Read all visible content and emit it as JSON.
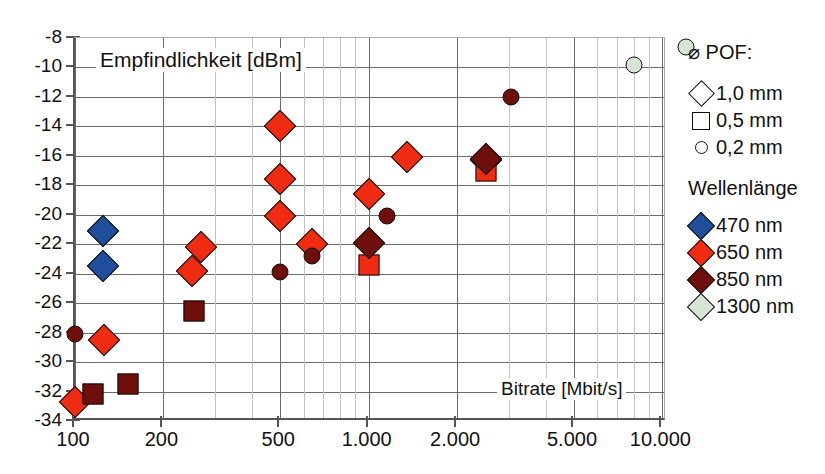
{
  "chart_data": {
    "type": "scatter",
    "title": "",
    "xlabel": "Bitrate [Mbit/s]",
    "ylabel": "Empfindlichkeit [dBm]",
    "xscale": "log",
    "xlim": [
      100,
      13000
    ],
    "ylim": [
      -34,
      -8
    ],
    "grid": true,
    "legend_position": "right",
    "xticks": [
      "100",
      "200",
      "500",
      "1.000",
      "2.000",
      "5.000",
      "10.000"
    ],
    "xtick_values": [
      100,
      200,
      500,
      1000,
      2000,
      5000,
      10000
    ],
    "yticks": [
      "-8",
      "-10",
      "-12",
      "-14",
      "-16",
      "-18",
      "-20",
      "-22",
      "-24",
      "-26",
      "-28",
      "-30",
      "-32",
      "-34"
    ],
    "ytick_values": [
      -8,
      -10,
      -12,
      -14,
      -16,
      -18,
      -20,
      -22,
      -24,
      -26,
      -28,
      -30,
      -32,
      -34
    ],
    "series": [
      {
        "name": "470 nm",
        "color": "#1f4e9c",
        "points": [
          {
            "x": 125,
            "y": -21.1,
            "marker": "diamond",
            "pof": "1,0 mm"
          },
          {
            "x": 125,
            "y": -23.5,
            "marker": "diamond",
            "pof": "1,0 mm"
          }
        ]
      },
      {
        "name": "650 nm",
        "color": "#ef2b11",
        "points": [
          {
            "x": 100,
            "y": -32.7,
            "marker": "diamond",
            "pof": "1,0 mm"
          },
          {
            "x": 126,
            "y": -28.5,
            "marker": "diamond",
            "pof": "1,0 mm"
          },
          {
            "x": 250,
            "y": -23.8,
            "marker": "diamond",
            "pof": "1,0 mm"
          },
          {
            "x": 268,
            "y": -22.2,
            "marker": "diamond",
            "pof": "1,0 mm"
          },
          {
            "x": 500,
            "y": -14.0,
            "marker": "diamond",
            "pof": "1,0 mm"
          },
          {
            "x": 500,
            "y": -17.6,
            "marker": "diamond",
            "pof": "1,0 mm"
          },
          {
            "x": 500,
            "y": -20.1,
            "marker": "diamond",
            "pof": "1,0 mm"
          },
          {
            "x": 640,
            "y": -22.0,
            "marker": "diamond",
            "pof": "1,0 mm"
          },
          {
            "x": 1000,
            "y": -18.6,
            "marker": "diamond",
            "pof": "1,0 mm"
          },
          {
            "x": 1350,
            "y": -16.1,
            "marker": "diamond",
            "pof": "1,0 mm"
          },
          {
            "x": 2500,
            "y": -16.3,
            "marker": "diamond",
            "pof": "1,0 mm"
          },
          {
            "x": 1000,
            "y": -23.4,
            "marker": "square",
            "pof": "0,5 mm"
          },
          {
            "x": 2500,
            "y": -17.0,
            "marker": "square",
            "pof": "0,5 mm"
          }
        ]
      },
      {
        "name": "850 nm",
        "color": "#6e0f0b",
        "points": [
          {
            "x": 1000,
            "y": -21.9,
            "marker": "diamond",
            "pof": "1,0 mm"
          },
          {
            "x": 2500,
            "y": -16.2,
            "marker": "diamond",
            "pof": "1,0 mm"
          },
          {
            "x": 115,
            "y": -32.2,
            "marker": "square",
            "pof": "0,5 mm"
          },
          {
            "x": 152,
            "y": -31.5,
            "marker": "square",
            "pof": "0,5 mm"
          },
          {
            "x": 255,
            "y": -26.5,
            "marker": "square",
            "pof": "0,5 mm"
          },
          {
            "x": 100,
            "y": -28.1,
            "marker": "circle",
            "pof": "0,2 mm"
          },
          {
            "x": 500,
            "y": -23.9,
            "marker": "circle",
            "pof": "0,2 mm"
          },
          {
            "x": 640,
            "y": -22.8,
            "marker": "circle",
            "pof": "0,2 mm"
          },
          {
            "x": 1150,
            "y": -20.1,
            "marker": "circle",
            "pof": "0,2 mm"
          },
          {
            "x": 3050,
            "y": -12.0,
            "marker": "circle",
            "pof": "0,2 mm"
          }
        ]
      },
      {
        "name": "1300 nm",
        "color": "#d6e4d6",
        "points": [
          {
            "x": 8000,
            "y": -9.8,
            "marker": "circle",
            "pof": "0,2 mm"
          },
          {
            "x": 12000,
            "y": -8.6,
            "marker": "circle",
            "pof": "0,2 mm"
          }
        ]
      }
    ]
  },
  "legend": {
    "pof_title": "⌀ POF:",
    "pof_items": [
      {
        "label": "1,0 mm",
        "icon": "diamond-outline-icon"
      },
      {
        "label": "0,5 mm",
        "icon": "square-outline-icon"
      },
      {
        "label": "0,2 mm",
        "icon": "circle-outline-icon"
      }
    ],
    "wavelength_title": "Wellenlänge",
    "wavelength_items": [
      {
        "label": "470 nm",
        "color": "#1f4e9c"
      },
      {
        "label": "650 nm",
        "color": "#ef2b11"
      },
      {
        "label": "850 nm",
        "color": "#6e0f0b"
      },
      {
        "label": "1300 nm",
        "color": "#d6e4d6"
      }
    ]
  },
  "colors": {
    "blue_470": "#1f4e9c",
    "red_650": "#ef2b11",
    "darkred_850": "#6e0f0b",
    "palegreen_1300": "#d6e4d6",
    "grid_major": "#6b6b6b",
    "grid_minor": "#c2c2c2",
    "axis": "#555555"
  }
}
